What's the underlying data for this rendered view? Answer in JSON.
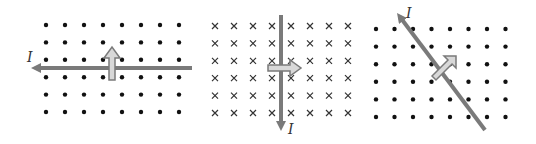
{
  "diagram": {
    "colors": {
      "dot": "#111111",
      "cross": "#333333",
      "wire": "#7a7a7a",
      "force_fill": "#d8d8d8",
      "force_stroke": "#7a7a7a"
    },
    "panels": [
      {
        "field": "out-of-page",
        "field_symbol": "dot",
        "grid": {
          "x0": 46,
          "y0": 25,
          "dx": 19,
          "dy": 17.4,
          "cols": 8,
          "rows": 6
        },
        "current_label": "I",
        "current_direction": "left",
        "force_direction": "up"
      },
      {
        "field": "into-page",
        "field_symbol": "cross",
        "grid": {
          "x0": 215,
          "y0": 26,
          "dx": 19,
          "dy": 17.4,
          "cols": 8,
          "rows": 6
        },
        "current_label": "I",
        "current_direction": "down",
        "force_direction": "right"
      },
      {
        "field": "out-of-page",
        "field_symbol": "dot",
        "grid": {
          "x0": 376,
          "y0": 29,
          "dx": 18.5,
          "dy": 17.6,
          "cols": 8,
          "rows": 6
        },
        "current_label": "I",
        "current_direction": "up-left",
        "force_direction": "up-right"
      }
    ]
  }
}
